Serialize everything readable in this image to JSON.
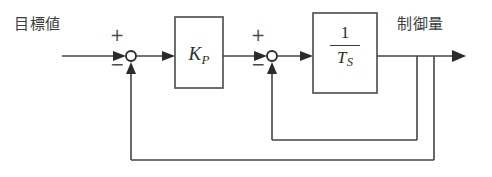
{
  "diagram": {
    "type": "control-system-block-diagram",
    "title": "",
    "background_color": "#ffffff",
    "line_color": "#444444",
    "text_color": "#3c3c3c",
    "labels": {
      "input": "目標値",
      "output": "制御量"
    },
    "blocks": [
      {
        "id": "gain",
        "name": "proportional-gain-block",
        "symbol": "K",
        "subscript": "P",
        "x": 175,
        "y": 17,
        "width": 48,
        "height": 71
      },
      {
        "id": "integrator",
        "name": "integrator-block",
        "numerator": "1",
        "denominator_symbol": "T",
        "denominator_subscript": "S",
        "x": 313,
        "y": 13,
        "width": 64,
        "height": 80
      }
    ],
    "summing_junctions": [
      {
        "id": "sum1",
        "name": "outer-summing-junction",
        "cx": 131,
        "cy": 56,
        "r": 5,
        "plus_sign": "+",
        "minus_sign": "−"
      },
      {
        "id": "sum2",
        "name": "inner-summing-junction",
        "cx": 272,
        "cy": 56,
        "r": 5,
        "plus_sign": "+",
        "minus_sign": "−"
      }
    ],
    "signal_line_y": 56,
    "feedback_loops": [
      {
        "id": "inner",
        "name": "inner-feedback-loop",
        "tap_x": 417,
        "bottom_y": 140,
        "riser_x": 272
      },
      {
        "id": "outer",
        "name": "outer-feedback-loop",
        "tap_x": 434,
        "bottom_y": 160,
        "riser_x": 131
      }
    ],
    "input_arrow": {
      "start_x": 62,
      "end_x": 126
    },
    "output_arrow": {
      "start_x": 377,
      "end_x": 466
    }
  }
}
